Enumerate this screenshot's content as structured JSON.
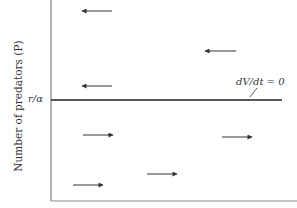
{
  "chart_data": {
    "type": "diagram",
    "title": "",
    "ylabel": "Number of predators (P)",
    "xlabel": "",
    "y_level_label": "r/α",
    "isocline": {
      "label": "dV/dt = 0",
      "y_px": 100,
      "x_start_px": 51,
      "x_end_px": 282
    },
    "arrows": [
      {
        "direction": "left",
        "x1": 112,
        "x2": 82,
        "y": 11,
        "region": "above"
      },
      {
        "direction": "left",
        "x1": 236,
        "x2": 205,
        "y": 51,
        "region": "above"
      },
      {
        "direction": "left",
        "x1": 112,
        "x2": 82,
        "y": 86,
        "region": "above"
      },
      {
        "direction": "right",
        "x1": 83,
        "x2": 113,
        "y": 135,
        "region": "below"
      },
      {
        "direction": "right",
        "x1": 222,
        "x2": 252,
        "y": 137,
        "region": "below"
      },
      {
        "direction": "right",
        "x1": 73,
        "x2": 103,
        "y": 185,
        "region": "below"
      },
      {
        "direction": "right",
        "x1": 147,
        "x2": 177,
        "y": 174,
        "region": "below"
      }
    ],
    "colors": {
      "axis": "#555555",
      "isocline": "#222222",
      "arrow": "#333333"
    }
  },
  "labels": {
    "ylabel": "Number of predators (P)",
    "y_level": "r/α",
    "isocline": "dV/dt = 0"
  }
}
